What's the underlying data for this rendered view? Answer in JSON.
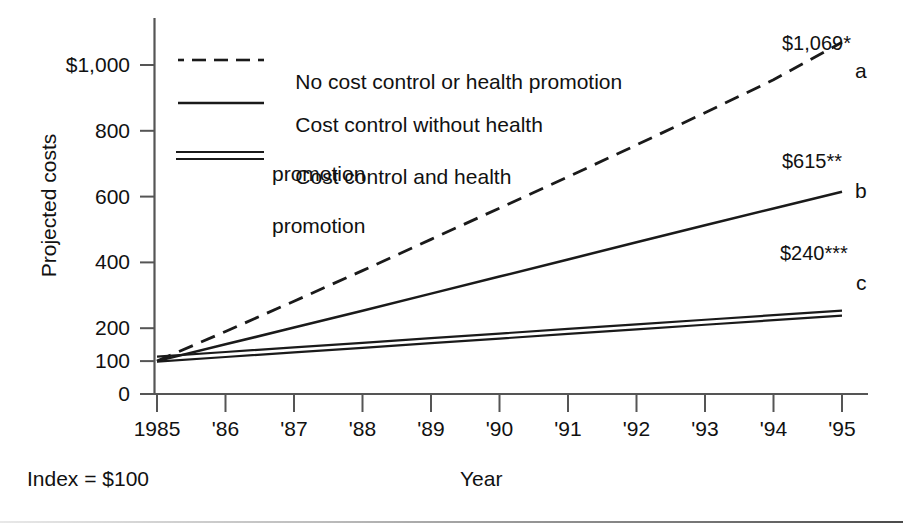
{
  "figure": {
    "y_axis_title": "Projected costs",
    "x_axis_title": "Year",
    "index_note": "Index = $100"
  },
  "chart_data": {
    "type": "line",
    "title": "",
    "xlabel": "Year",
    "ylabel": "Projected costs",
    "xlim": [
      1984.6,
      1995.6
    ],
    "ylim": [
      0,
      1100
    ],
    "grid": false,
    "legend_position": "upper-left-inside",
    "x": [
      1985,
      1986,
      1987,
      1988,
      1989,
      1990,
      1991,
      1992,
      1993,
      1994,
      1995
    ],
    "xtick_labels": [
      "1985",
      "'86",
      "'87",
      "'88",
      "'89",
      "'90",
      "'91",
      "'92",
      "'93",
      "'94",
      "'95"
    ],
    "ytick_labels": [
      "$1,000",
      "800",
      "600",
      "400",
      "200",
      "100",
      "0"
    ],
    "ytick_values": [
      1000,
      800,
      600,
      400,
      200,
      100,
      0
    ],
    "series": [
      {
        "key": "a",
        "name": "No cost control or health promotion",
        "style": "dashed",
        "end_label": "$1,069*",
        "end_letter": "a",
        "end_value": 1069,
        "values": [
          100,
          190,
          282,
          375,
          470,
          565,
          660,
          757,
          855,
          955,
          1069
        ]
      },
      {
        "key": "b",
        "name": "Cost control without health promotion",
        "style": "solid",
        "end_label": "$615**",
        "end_letter": "b",
        "end_value": 615,
        "values": [
          100,
          151,
          202,
          253,
          305,
          357,
          409,
          461,
          513,
          564,
          615
        ]
      },
      {
        "key": "c",
        "name": "Cost control and health promotion",
        "style": "double",
        "end_label": "$240***",
        "end_letter": "c",
        "end_value": 240,
        "values": [
          100,
          114,
          128,
          142,
          156,
          170,
          184,
          198,
          212,
          226,
          240
        ]
      }
    ],
    "legend_entries": [
      {
        "marker": "dashed",
        "line1": "No cost control or health promotion",
        "line2": ""
      },
      {
        "marker": "solid",
        "line1": "Cost control without health",
        "line2": "promotion"
      },
      {
        "marker": "double",
        "line1": "Cost control and health",
        "line2": "promotion"
      }
    ],
    "colors": {
      "line": "#1a1a1a",
      "axis": "#555555",
      "text": "#111111",
      "background": "#ffffff"
    }
  }
}
